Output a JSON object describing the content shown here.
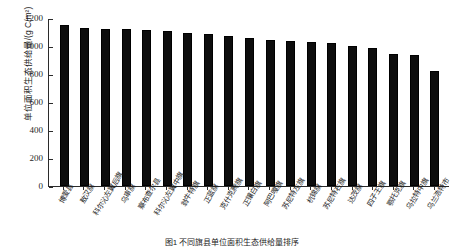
{
  "chart_data": {
    "type": "bar",
    "title": "",
    "xlabel": "",
    "ylabel": "单位面积生态供给量/(g C/m²)",
    "ylim": [
      0,
      1200
    ],
    "yticks": [
      0,
      200,
      400,
      600,
      800,
      1000,
      1200
    ],
    "grid": false,
    "legend": null,
    "bar_color": "#0d0d0d",
    "axis_color": "#2b2b2b",
    "categories": [
      "博爱县",
      "敖汉旗",
      "科尔沁左翼后旗",
      "乌审旗",
      "察布查尔县",
      "科尔沁左翼中旗",
      "翁牛特旗",
      "正蓝旗",
      "克什克腾旗",
      "正镶白旗",
      "阿巴嘎旗",
      "苏尼特左旗",
      "杭锦旗",
      "苏尼特右旗",
      "达茂旗",
      "四子王旗",
      "鄂托克旗",
      "乌拉特中旗",
      "乌兰浩特市"
    ],
    "values": [
      1150,
      1130,
      1125,
      1120,
      1115,
      1105,
      1095,
      1085,
      1070,
      1060,
      1045,
      1035,
      1030,
      1020,
      1000,
      985,
      945,
      935,
      820
    ],
    "units": "g C/m²"
  },
  "figure": {
    "caption": "图1  不同旗县单位面积生态供给量排序"
  }
}
